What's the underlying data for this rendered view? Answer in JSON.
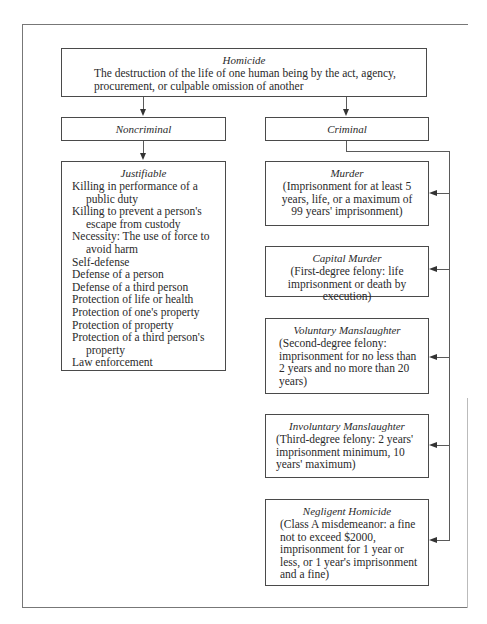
{
  "diagram": {
    "root": {
      "title": "Homicide",
      "description": "The destruction of the life of one human being by the act, agency, procurement, or culpable omission of another"
    },
    "branches": {
      "noncriminal": {
        "label": "Noncriminal",
        "justifiable": {
          "title": "Justifiable",
          "items": [
            "Killing in performance of a public duty",
            "Killing to prevent a person's escape from custody",
            "Necessity: The use of force to avoid harm",
            "Self-defense",
            "Defense of a person",
            "Defense of a third person",
            "Protection of life or health",
            "Protection of one's property",
            "Protection of property",
            "Protection of a third person's property",
            "Law enforcement"
          ]
        }
      },
      "criminal": {
        "label": "Criminal",
        "categories": [
          {
            "title": "Murder",
            "description": "(Imprisonment for at least 5 years, life, or a maximum of 99 years' imprisonment)"
          },
          {
            "title": "Capital Murder",
            "description": "(First-degree felony: life imprisonment or death by execution)"
          },
          {
            "title": "Voluntary Manslaughter",
            "description": "(Second-degree felony: imprisonment for no less than 2 years and no more than 20 years)"
          },
          {
            "title": "Involuntary Manslaughter",
            "description": "(Third-degree felony: 2 years' imprisonment minimum, 10 years' maximum)"
          },
          {
            "title": "Negligent Homicide",
            "description": "(Class A misdemeanor: a fine not to exceed $2000, imprisonment for 1 year or less, or 1 year's imprisonment and a fine)"
          }
        ]
      }
    },
    "colors": {
      "line": "#5a5a5a",
      "text": "#2a2a2a",
      "background": "#ffffff"
    }
  }
}
